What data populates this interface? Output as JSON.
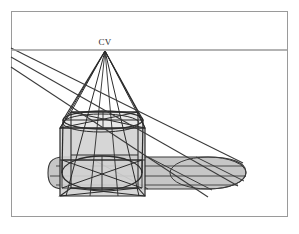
{
  "figure": {
    "title_label": "CV",
    "caption_label": "",
    "width": 299,
    "height": 234,
    "background_color": "#ffffff",
    "frame": {
      "name": "figure-frame",
      "color": "#9a9a9a",
      "stroke_width": 1,
      "x": 11,
      "y": 11,
      "width": 277,
      "height": 206
    },
    "horizon": {
      "label": "horizon-line",
      "color": "#9a9a9a",
      "stroke_width": 1.6,
      "y": 50,
      "x1": 11,
      "x2": 288
    },
    "vanishing_point": {
      "label": "CV",
      "x": 105,
      "y": 50,
      "label_x": 105,
      "label_y": 45
    },
    "light_rays": {
      "name": "light-rays",
      "color": "#3a3a3a",
      "stroke_width": 1.1,
      "count": 3,
      "origins": [
        {
          "x": 11,
          "y": 48
        },
        {
          "x": 11,
          "y": 57
        },
        {
          "x": 11,
          "y": 67
        }
      ],
      "ends": [
        {
          "x": 240,
          "y": 162
        },
        {
          "x": 236,
          "y": 185
        },
        {
          "x": 205,
          "y": 196
        }
      ]
    },
    "box": {
      "name": "perspective-box",
      "stroke_color": "#3a3a3a",
      "fill_color": "#d2d2d2",
      "stroke_width": 1.2,
      "top_y": 123,
      "bottom_y": 196,
      "left_x": 60,
      "right_x": 145
    },
    "cylinder": {
      "name": "inscribed-cylinder",
      "stroke_color": "#2b2b2b",
      "stroke_width": 1.2,
      "top_ellipse": {
        "cx": 103,
        "cy": 118,
        "rx": 42,
        "ry": 11
      },
      "bottom_ellipse": {
        "cx": 103,
        "cy": 172,
        "rx": 39,
        "ry": 15
      }
    },
    "shadow": {
      "name": "cast-shadow",
      "fill_color": "#c6c6c6",
      "stroke_color": "#3a3a3a",
      "stroke_width": 1.1,
      "extends_to_x": 245,
      "rounded_end": true
    },
    "projection_cone": {
      "name": "projection-cone-lines",
      "color": "#2b2b2b",
      "stroke_width": 1.1,
      "apex_x": 105,
      "apex_y": 50
    },
    "colors": {
      "ink": "#2b2b2b",
      "ink_light": "#3a3a3a",
      "frame": "#9a9a9a",
      "fill_light": "#d2d2d2",
      "fill_shadow": "#c6c6c6",
      "background": "#ffffff"
    }
  }
}
